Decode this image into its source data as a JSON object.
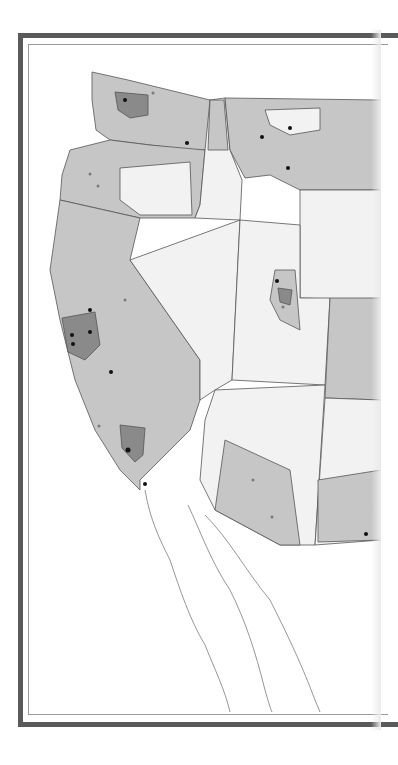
{
  "map": {
    "title": "",
    "region": "Western United States and Baja California",
    "colors": {
      "frame": "#5a5a5a",
      "inner_border": "#9a9a9a",
      "state_line": "#4a4a4a",
      "low": "#f2f2f2",
      "mid": "#c6c6c6",
      "high": "#8a8a8a",
      "dot_black": "#111111",
      "dot_gray": "#7a7a7a",
      "coast": "#6a6a6a"
    },
    "legend": [],
    "labels": []
  }
}
